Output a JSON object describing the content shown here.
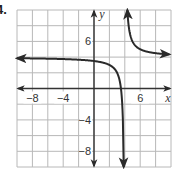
{
  "problem": {
    "number_label": "4."
  },
  "chart_data": {
    "type": "line",
    "title": "",
    "xlabel": "x",
    "ylabel": "y",
    "xlim": [
      -10,
      10
    ],
    "ylim": [
      -10,
      10
    ],
    "grid": true,
    "grid_step": 2,
    "x_tick_labels": [
      {
        "value": -8,
        "label": "−8"
      },
      {
        "value": -4,
        "label": "−4"
      },
      {
        "value": 6,
        "label": "6"
      }
    ],
    "y_tick_labels": [
      {
        "value": 6,
        "label": "6"
      },
      {
        "value": -4,
        "label": "−4"
      },
      {
        "value": -8,
        "label": "−8"
      }
    ],
    "function": "y = 4 + 2/(x - 4)",
    "asymptotes": {
      "vertical": 4,
      "horizontal": 4
    },
    "series": [
      {
        "name": "left branch",
        "x": [
          -10,
          -8,
          -6,
          -4,
          -2,
          0,
          1,
          2,
          3,
          3.5,
          3.8
        ],
        "y": [
          3.86,
          3.83,
          3.8,
          3.75,
          3.67,
          3.5,
          3.33,
          3.0,
          2.0,
          0.0,
          -6.0
        ]
      },
      {
        "name": "right branch",
        "x": [
          4.33,
          4.5,
          5,
          6,
          7,
          8,
          10
        ],
        "y": [
          10.0,
          8.0,
          6.0,
          5.0,
          4.67,
          4.5,
          4.33
        ]
      }
    ],
    "colors": {
      "curve": "#2a2a2a",
      "axis": "#333333",
      "grid": "#b8b8b8"
    }
  }
}
